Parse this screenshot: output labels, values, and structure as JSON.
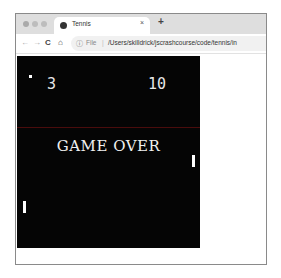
{
  "browser": {
    "tab": {
      "title": "Tennis",
      "close_glyph": "×",
      "favicon": "globe-icon"
    },
    "new_tab_glyph": "+",
    "toolbar": {
      "back_glyph": "←",
      "forward_glyph": "→",
      "reload_glyph": "C",
      "home_glyph": "⌂",
      "info_glyph": "ⓘ",
      "file_label": "File",
      "separator": "|",
      "url": "/Users/skilldrick/jscrashcourse/code/tennis/in"
    }
  },
  "game": {
    "left_score": "3",
    "right_score": "10",
    "status_text": "GAME OVER",
    "colors": {
      "background": "#050505",
      "foreground": "#ffffff",
      "net": "#4a0c0c"
    }
  }
}
